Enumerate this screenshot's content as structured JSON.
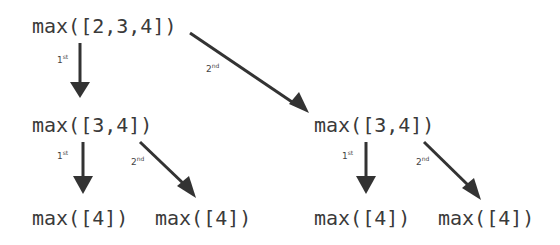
{
  "diagram": {
    "nodes": {
      "root": "max([2,3,4])",
      "left": "max([3,4])",
      "right": "max([3,4])",
      "left_left": "max([4])",
      "left_right": "max([4])",
      "right_left": "max([4])",
      "right_right": "max([4])"
    },
    "labels": {
      "first_num": "1",
      "first_sup": "st",
      "second_num": "2",
      "second_sup": "nd"
    },
    "colors": {
      "text": "#3a3a3a",
      "arrow": "#333333",
      "background": "#ffffff"
    }
  }
}
